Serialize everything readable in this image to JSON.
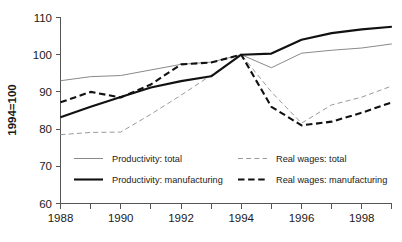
{
  "chart_data": {
    "type": "line",
    "title": "",
    "xlabel": "",
    "ylabel": "1994=100",
    "xlim": [
      1988,
      1999
    ],
    "ylim": [
      60,
      110
    ],
    "grid": false,
    "legend_position": "inside-bottom",
    "x": [
      1988,
      1989,
      1990,
      1991,
      1992,
      1993,
      1994,
      1995,
      1996,
      1997,
      1998,
      1999
    ],
    "xticks": [
      1988,
      1990,
      1992,
      1994,
      1996,
      1998
    ],
    "xticklabels": [
      "1988",
      "1990",
      "1992",
      "1994",
      "1996",
      "1998"
    ],
    "xminorticks": [
      1989,
      1991,
      1993,
      1995,
      1997,
      1999
    ],
    "yticks": [
      60,
      70,
      80,
      90,
      100,
      110
    ],
    "yticklabels": [
      "60",
      "70",
      "80",
      "90",
      "100",
      "110"
    ],
    "series": [
      {
        "name": "Productivity: total",
        "style": "thin-solid",
        "values": [
          93.0,
          94.1,
          94.4,
          95.9,
          97.4,
          98.0,
          100.0,
          96.5,
          100.4,
          101.2,
          101.8,
          102.9
        ]
      },
      {
        "name": "Productivity: manufacturing",
        "style": "thick-solid",
        "values": [
          83.2,
          86.0,
          88.6,
          91.2,
          92.9,
          94.2,
          100.0,
          100.3,
          104.0,
          105.8,
          106.8,
          107.5
        ]
      },
      {
        "name": "Real wages: total",
        "style": "thin-dashed",
        "values": [
          78.5,
          79.1,
          79.2,
          84.0,
          89.1,
          94.5,
          100.0,
          90.0,
          81.6,
          86.5,
          88.6,
          91.6
        ]
      },
      {
        "name": "Real wages: manufacturing",
        "style": "thick-dashed",
        "values": [
          87.2,
          90.0,
          88.5,
          92.0,
          97.4,
          97.9,
          100.0,
          86.0,
          81.0,
          82.0,
          84.4,
          87.2
        ]
      }
    ]
  },
  "legend": {
    "entries": [
      {
        "label": "Productivity: total",
        "style": "thin-solid"
      },
      {
        "label": "Real wages: total",
        "style": "thin-dashed"
      },
      {
        "label": "Productivity: manufacturing",
        "style": "thick-solid"
      },
      {
        "label": "Real wages: manufacturing",
        "style": "thick-dashed"
      }
    ]
  }
}
